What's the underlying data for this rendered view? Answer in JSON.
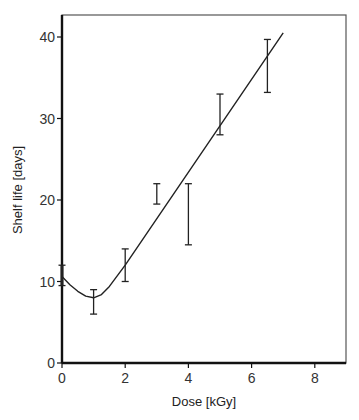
{
  "chart_data": {
    "type": "line",
    "title": "",
    "xlabel": "Dose [kGy]",
    "ylabel": "Shelf life [days]",
    "xlim": [
      0,
      9
    ],
    "ylim": [
      0,
      43
    ],
    "x_ticks": [
      0,
      2,
      4,
      6,
      8
    ],
    "y_ticks": [
      0,
      10,
      20,
      30,
      40
    ],
    "grid": false,
    "legend": null,
    "series": [
      {
        "name": "measured",
        "kind": "errorbar",
        "points": [
          {
            "x": 0,
            "y": 10.5,
            "low": 9.5,
            "high": 12
          },
          {
            "x": 1,
            "y": 7.5,
            "low": 6,
            "high": 9
          },
          {
            "x": 2,
            "y": 12,
            "low": 10,
            "high": 14
          },
          {
            "x": 3,
            "y": 20.8,
            "low": 19.5,
            "high": 22
          },
          {
            "x": 4,
            "y": 18,
            "low": 14.5,
            "high": 22
          },
          {
            "x": 5,
            "y": 30.5,
            "low": 28,
            "high": 33
          },
          {
            "x": 6.5,
            "y": 36.5,
            "low": 33.2,
            "high": 39.7
          }
        ]
      },
      {
        "name": "fit",
        "kind": "line",
        "points": [
          {
            "x": 0,
            "y": 10.6
          },
          {
            "x": 0.25,
            "y": 9.6
          },
          {
            "x": 0.5,
            "y": 8.8
          },
          {
            "x": 0.75,
            "y": 8.2
          },
          {
            "x": 1.0,
            "y": 8.0
          },
          {
            "x": 1.25,
            "y": 8.4
          },
          {
            "x": 1.5,
            "y": 9.4
          },
          {
            "x": 2.0,
            "y": 12.0
          },
          {
            "x": 7.0,
            "y": 40.5
          }
        ]
      }
    ]
  }
}
